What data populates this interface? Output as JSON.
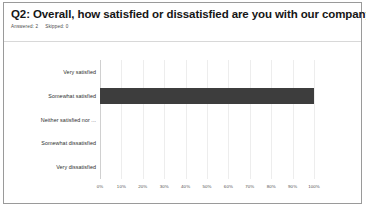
{
  "card": {
    "title": "Q2: Overall, how satisfied or dissatisfied are you with our company?",
    "answered_label": "Answered: 2",
    "skipped_label": "Skipped: 0"
  },
  "colors": {
    "bar": "#3d3d3d",
    "border": "#9a9a9a",
    "gridline": "#ededed",
    "title_text": "#161616",
    "label_text": "#2e2e2e"
  },
  "chart_data": {
    "type": "bar",
    "orientation": "horizontal",
    "title": "Q2: Overall, how satisfied or dissatisfied are you with our company?",
    "xlabel": "",
    "ylabel": "",
    "categories": [
      "Very satisfied",
      "Somewhat satisfied",
      "Neither satisfied nor ...",
      "Somewhat dissatisfied",
      "Very dissatisfied"
    ],
    "values": [
      0,
      100,
      0,
      0,
      0
    ],
    "xlim": [
      0,
      100
    ],
    "xticks": [
      0,
      10,
      20,
      30,
      40,
      50,
      60,
      70,
      80,
      90,
      100
    ],
    "xticklabels": [
      "0%",
      "10%",
      "20%",
      "30%",
      "40%",
      "50%",
      "60%",
      "70%",
      "80%",
      "90%",
      "100%"
    ],
    "grid": true,
    "legend": false,
    "series": [
      {
        "name": "Responses",
        "values": [
          0,
          100,
          0,
          0,
          0
        ]
      }
    ]
  }
}
